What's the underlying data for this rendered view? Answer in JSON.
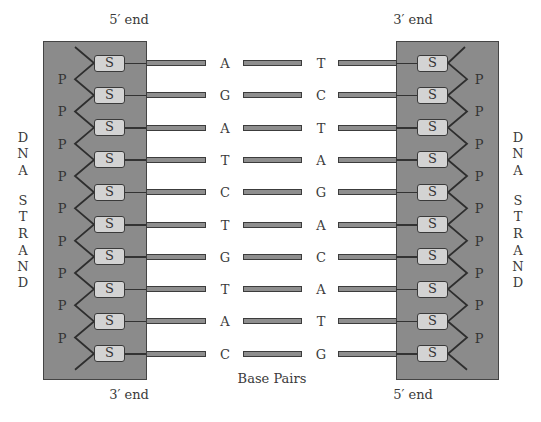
{
  "diagram": {
    "top_left_label": "5′ end",
    "top_right_label": "3′ end",
    "bottom_left_label": "3′ end",
    "bottom_right_label": "5′ end",
    "center_caption": "Base Pairs",
    "side_label_letters": [
      "D",
      "N",
      "A",
      "S",
      "T",
      "R",
      "A",
      "N",
      "D"
    ],
    "sugar_label": "S",
    "phosphate_label": "P",
    "base_pairs": [
      {
        "left": "A",
        "right": "T"
      },
      {
        "left": "G",
        "right": "C"
      },
      {
        "left": "A",
        "right": "T"
      },
      {
        "left": "T",
        "right": "A"
      },
      {
        "left": "C",
        "right": "G"
      },
      {
        "left": "T",
        "right": "A"
      },
      {
        "left": "G",
        "right": "C"
      },
      {
        "left": "T",
        "right": "A"
      },
      {
        "left": "A",
        "right": "T"
      },
      {
        "left": "C",
        "right": "G"
      }
    ],
    "colors": {
      "strand_fill": "#8b8b8b",
      "sugar_fill": "#d3d3d3",
      "bond_fill": "#8e8e8e",
      "outline": "#3a3a3a"
    }
  }
}
